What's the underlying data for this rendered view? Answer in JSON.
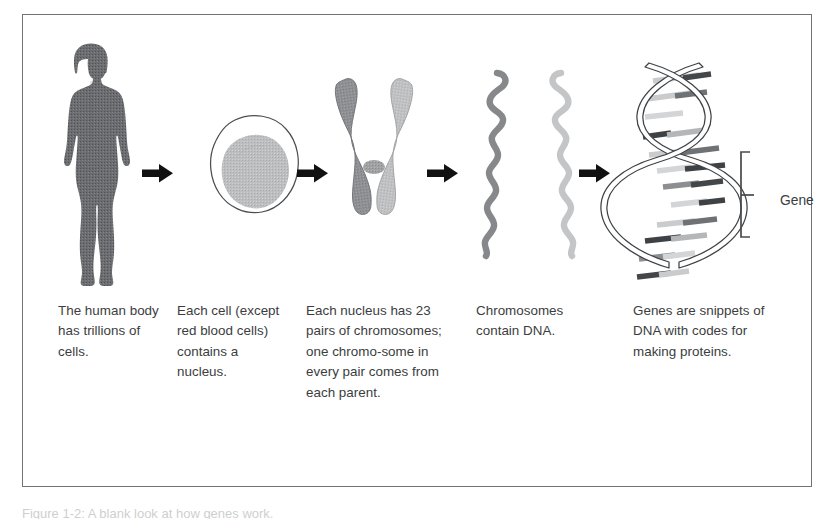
{
  "figure": {
    "frame_color": "#6f7276",
    "background": "#ffffff",
    "text_color": "#3b3d40",
    "arrow_color": "#111111"
  },
  "stages": [
    {
      "id": "body",
      "icon": "human-body-silhouette",
      "caption": "The human body has trillions of cells.",
      "color": "#6b6d70"
    },
    {
      "id": "cell",
      "icon": "cell-with-nucleus",
      "caption": "Each cell (except red blood cells) contains a nucleus.",
      "color": "#b9bbbd"
    },
    {
      "id": "chromosome",
      "icon": "chromosome-x-shape",
      "caption": "Each nucleus has 23 pairs of chromosomes; one chromo-some in every pair comes from each parent.",
      "color": "#8e9093"
    },
    {
      "id": "chromosomes",
      "icon": "chromosome-strands-pair",
      "caption": "Chromosomes contain DNA.",
      "color": "#9b9d9f"
    },
    {
      "id": "dna",
      "icon": "dna-double-helix",
      "caption": "Genes are snippets of DNA with codes for making proteins.",
      "color": "#55585b"
    }
  ],
  "arrows": [
    {
      "id": "arrow-body-to-cell",
      "glyph": "right-arrow"
    },
    {
      "id": "arrow-cell-to-chromosome",
      "glyph": "right-arrow"
    },
    {
      "id": "arrow-chromosome-to-chromosomes",
      "glyph": "right-arrow"
    },
    {
      "id": "arrow-chromosomes-to-dna",
      "glyph": "right-arrow"
    }
  ],
  "annotation": {
    "gene_label": "Gene"
  },
  "figure_caption": "Figure  1-2:  A  blank  look  at  how  genes  work."
}
